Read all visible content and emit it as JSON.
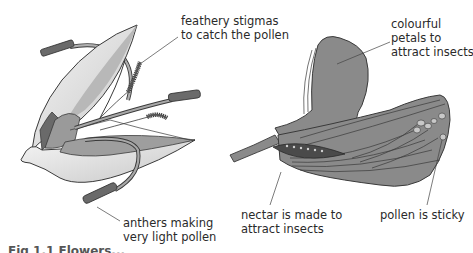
{
  "figure": {
    "caption": "Fig 1.1 Flowers...",
    "colors": {
      "petal_grey": "#8a8a8a",
      "petal_light": "#e8e8e8",
      "outline": "#3a3a3a",
      "nectary_dark": "#4a4a4a",
      "background": "#ffffff"
    }
  },
  "wind_flower": {
    "name": "wind-pollinated flower",
    "labels": [
      {
        "id": "stigmas",
        "line1": "feathery stigmas",
        "line2": "to catch the pollen"
      },
      {
        "id": "anthers",
        "line1": "anthers making",
        "line2": "very light pollen"
      }
    ]
  },
  "insect_flower": {
    "name": "insect-pollinated flower",
    "labels": [
      {
        "id": "petals",
        "line1": "colourful",
        "line2": "petals to",
        "line3": "attract insects"
      },
      {
        "id": "nectar",
        "line1": "nectar is made to",
        "line2": "attract insects"
      },
      {
        "id": "pollen",
        "line1": "pollen is sticky"
      }
    ]
  }
}
